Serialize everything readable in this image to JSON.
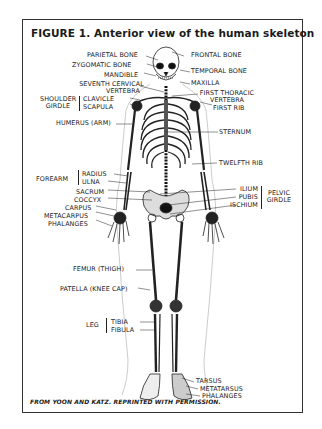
{
  "figure": {
    "title": "FIGURE 1. Anterior view of the human skeleton",
    "credit": "FROM YOON AND KATZ. REPRINTED WITH PERMISSION."
  },
  "labels": {
    "left": {
      "parietal_bone": "PARIETAL BONE",
      "zygomatic_bone": "ZYGOMATIC BONE",
      "mandible": "MANDIBLE",
      "seventh_cervical_1": "SEVENTH CERVICAL",
      "seventh_cervical_2": "VERTEBRA",
      "shoulder_girdle_1": "SHOULDER",
      "shoulder_girdle_2": "GIRDLE",
      "clavicle": "CLAVICLE",
      "scapula": "SCAPULA",
      "humerus": "HUMERUS (ARM)",
      "forearm": "FOREARM",
      "radius": "RADIUS",
      "ulna": "ULNA",
      "sacrum": "SACRUM",
      "coccyx": "COCCYX",
      "carpus": "CARPUS",
      "metacarpus": "METACARPUS",
      "phalanges": "PHALANGES",
      "femur": "FEMUR (THIGH)",
      "patella": "PATELLA (KNEE CAP)",
      "leg": "LEG",
      "tibia": "TIBIA",
      "fibula": "FIBULA"
    },
    "right": {
      "frontal_bone": "FRONTAL BONE",
      "temporal_bone": "TEMPORAL BONE",
      "maxilla": "MAXILLA",
      "first_thoracic_1": "FIRST THORACIC",
      "first_thoracic_2": "VERTEBRA",
      "first_rib": "FIRST RIB",
      "sternum": "STERNUM",
      "twelfth_rib": "TWELFTH RIB",
      "ilium": "ILIUM",
      "pubis": "PUBIS",
      "ischium": "ISCHIUM",
      "pelvic_girdle_1": "PELVIC",
      "pelvic_girdle_2": "GIRDLE",
      "tarsus": "TARSUS",
      "metatarsus": "METATARSUS",
      "phalanges": "PHALANGES"
    }
  }
}
